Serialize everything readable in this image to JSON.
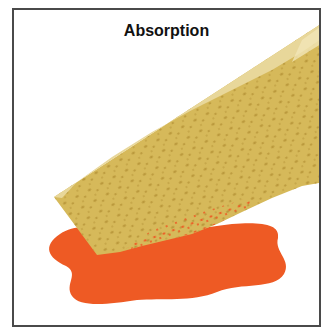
{
  "figure": {
    "title": "Absorption",
    "elements": [
      {
        "name": "sponge",
        "description": "tilted yellow porous sponge"
      },
      {
        "name": "liquid-puddle",
        "description": "orange-red puddle being absorbed"
      }
    ],
    "colors": {
      "frame": "#4a4a4a",
      "sponge_face": "#d6b95a",
      "sponge_top": "#e8d79a",
      "sponge_pores": "#b8963a",
      "liquid": "#ee5a24",
      "background": "#ffffff"
    }
  }
}
